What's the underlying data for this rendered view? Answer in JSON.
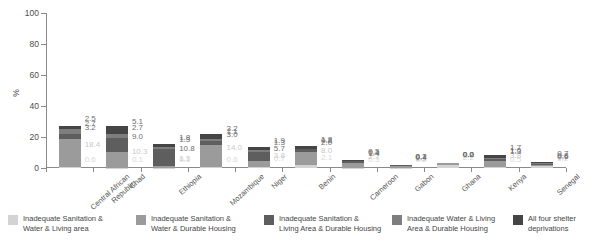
{
  "chart_data": {
    "type": "bar",
    "stacked": true,
    "title": "",
    "xlabel": "",
    "ylabel": "%",
    "ylim": [
      0,
      100
    ],
    "yticks": [
      0,
      20,
      40,
      60,
      80,
      100
    ],
    "grid": false,
    "legend_position": "bottom",
    "categories": [
      "Central African\nRepublic",
      "Chad",
      "Ethiopia",
      "Mozambique",
      "Niger",
      "Benin",
      "Cameroon",
      "Gabon",
      "Ghana",
      "Kenya",
      "Senegal"
    ],
    "series": [
      {
        "name": "Inadequate Sanitation & Water & Living area",
        "color": "#d3d3d3",
        "values": [
          0.6,
          0.1,
          0.1,
          0.6,
          0.7,
          2.1,
          0.3,
          0.2,
          2.2,
          0.5,
          1.2
        ]
      },
      {
        "name": "Inadequate Sanitation & Water & Durable Housing",
        "color": "#9b9b9b",
        "values": [
          18.4,
          10.3,
          1.3,
          14.0,
          3.8,
          8.0,
          2.7,
          1.2,
          1.0,
          3.8,
          0.7
        ]
      },
      {
        "name": "Inadequate Sanitation & Living Area & Durable Housing",
        "color": "#5e5e5e",
        "values": [
          3.2,
          9.0,
          10.8,
          3.0,
          5.7,
          2.0,
          1.4,
          0.4,
          0.2,
          1.3,
          0.6
        ]
      },
      {
        "name": "Inadequate Water & Living Area & Durable Housing",
        "color": "#7e7e7e",
        "values": [
          2.7,
          2.7,
          1.3,
          1.1,
          1.3,
          0.2,
          0.4,
          0.1,
          0.0,
          1.0,
          0.8
        ]
      },
      {
        "name": "All four shelter deprivations",
        "color": "#454545",
        "values": [
          2.5,
          5.1,
          1.8,
          3.2,
          1.9,
          1.8,
          0.5,
          0.2,
          0.0,
          1.7,
          0.7
        ]
      }
    ],
    "legend": [
      "Inadequate Sanitation &\nWater & Living area",
      "Inadequate Sanitation &\nWater & Durable Housing",
      "Inadequate Sanitation &\nLiving Area & Durable Housing",
      "Inadequate Water & Living\nArea & Durable Housing",
      "All four shelter deprivations"
    ]
  }
}
